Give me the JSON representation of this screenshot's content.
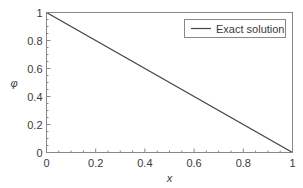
{
  "chart_data": {
    "type": "line",
    "title": "",
    "xlabel": "x",
    "ylabel": "φ",
    "xlim": [
      0,
      1
    ],
    "ylim": [
      0,
      1
    ],
    "xticks": [
      0,
      0.2,
      0.4,
      0.6,
      0.8,
      1
    ],
    "yticks": [
      0,
      0.2,
      0.4,
      0.6,
      0.8,
      1
    ],
    "xtick_labels": [
      "0",
      "0.2",
      "0.4",
      "0.6",
      "0.8",
      "1"
    ],
    "ytick_labels": [
      "0",
      "0.2",
      "0.4",
      "0.6",
      "0.8",
      "1"
    ],
    "minor_tick_step": 0.05,
    "grid": false,
    "legend_position": "upper right",
    "series": [
      {
        "name": "Exact solution",
        "x": [
          0,
          0.2,
          0.4,
          0.6,
          0.8,
          1
        ],
        "y": [
          1,
          0.8,
          0.6,
          0.4,
          0.2,
          0
        ],
        "color": "#444444",
        "style": "solid"
      }
    ]
  },
  "colors": {
    "frame": "#888888",
    "line": "#444444",
    "text": "#3a3a3a"
  }
}
